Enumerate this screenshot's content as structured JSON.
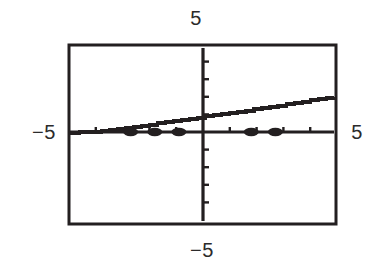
{
  "figure": {
    "kind": "graphing-calculator-plot",
    "background_color": "#ffffff",
    "ink_color": "#231f20"
  },
  "labels": {
    "top": "5",
    "bottom": "−5",
    "left": "−5",
    "right": "5"
  },
  "chart_data": {
    "type": "line",
    "title": "",
    "subtitle": "",
    "xlabel": "",
    "ylabel": "",
    "xlim": [
      -5,
      5
    ],
    "ylim": [
      -5,
      5
    ],
    "grid": false,
    "legend": null,
    "axis_tick_labels": {
      "x_min": "−5",
      "x_max": "5",
      "y_min": "−5",
      "y_max": "5"
    },
    "x_ticks": [
      -4,
      -3,
      -2,
      -1,
      1,
      2,
      3,
      4
    ],
    "y_ticks": [
      -4,
      -3,
      -2,
      -1,
      1,
      2,
      3,
      4
    ],
    "series": [
      {
        "name": "rising-staircase-curve",
        "style": "staircase-line",
        "x": [
          -5.0,
          -4.6,
          -4.2,
          -3.8,
          -3.5,
          -3.2,
          -2.9,
          -2.6,
          -2.3,
          -2.0,
          -1.7,
          -1.4,
          -1.1,
          -0.8,
          -0.5,
          -0.2,
          0.1,
          0.4,
          0.7,
          1.0,
          1.3,
          1.6,
          1.9,
          2.2,
          2.5,
          2.8,
          3.1,
          3.4,
          3.7,
          4.0,
          4.3,
          4.6,
          4.9
        ],
        "y": [
          -0.05,
          -0.02,
          0.0,
          0.05,
          0.1,
          0.16,
          0.22,
          0.3,
          0.36,
          0.42,
          0.5,
          0.56,
          0.62,
          0.7,
          0.76,
          0.82,
          0.9,
          0.96,
          1.02,
          1.1,
          1.16,
          1.22,
          1.3,
          1.36,
          1.44,
          1.5,
          1.58,
          1.64,
          1.72,
          1.8,
          1.86,
          1.94,
          2.0
        ]
      },
      {
        "name": "x-axis-markers",
        "style": "thick-dots-on-axis",
        "x": [
          -2.7,
          -1.8,
          -0.9,
          1.8,
          2.7
        ],
        "y": [
          0,
          0,
          0,
          0,
          0
        ]
      }
    ],
    "annotations": []
  },
  "geometry": {
    "frame": {
      "left": 68,
      "top": 44,
      "right": 337,
      "bottom": 225
    },
    "origin": {
      "x": 203,
      "y": 132
    }
  }
}
